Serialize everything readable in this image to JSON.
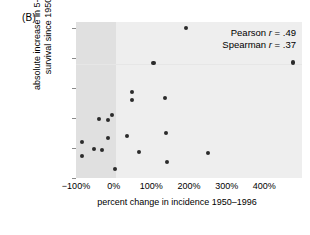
{
  "panel": {
    "label": "(B)"
  },
  "annotations": {
    "pearson_prefix": "Pearson ",
    "pearson_var": "r",
    "pearson_value": " = .49",
    "spearman_prefix": "Spearman ",
    "spearman_var": "r",
    "spearman_value": " = .37"
  },
  "axes": {
    "xlabel": "percent change in incidence 1950–1996",
    "ylabel_line1": "absolute increase in 5-year",
    "ylabel_line2": "survival since 1950",
    "xticks": [
      "−100%",
      "0%",
      "100%",
      "200%",
      "300%",
      "400%"
    ],
    "yticks": [
      "0%",
      "10%",
      "20%",
      "30%",
      "40%",
      "50%"
    ]
  },
  "chart_data": {
    "type": "scatter",
    "title": "(B)",
    "xlabel": "percent change in incidence 1950–1996",
    "ylabel": "absolute increase in 5-year survival since 1950",
    "xlim": [
      -100,
      500
    ],
    "ylim": [
      0,
      52
    ],
    "xticks": [
      -100,
      0,
      100,
      200,
      300,
      400
    ],
    "yticks": [
      0,
      10,
      20,
      30,
      40,
      50
    ],
    "xtick_labels": [
      "−100%",
      "0%",
      "100%",
      "200%",
      "300%",
      "400%"
    ],
    "ytick_labels": [
      "0%",
      "10%",
      "20%",
      "30%",
      "40%",
      "50%"
    ],
    "grid": false,
    "legend": "none",
    "plot_background": "#eeeeee",
    "shaded_region": {
      "x_from": -100,
      "x_to": 0,
      "color": "#e0e0e0",
      "note": "darker band left of 0% (decreasing incidence)"
    },
    "marker_color": "#2b2b2b",
    "statistics": {
      "pearson_r": 0.49,
      "spearman_r": 0.37
    },
    "points": [
      {
        "x": -83,
        "y": 12.0
      },
      {
        "x": -83,
        "y": 7.3
      },
      {
        "x": -52,
        "y": 9.8
      },
      {
        "x": -38,
        "y": 19.7
      },
      {
        "x": -30,
        "y": 9.3
      },
      {
        "x": -14,
        "y": 19.3
      },
      {
        "x": -14,
        "y": 13.3
      },
      {
        "x": -5,
        "y": 21.0
      },
      {
        "x": 3,
        "y": 2.9
      },
      {
        "x": 36,
        "y": 13.9
      },
      {
        "x": 49,
        "y": 28.7
      },
      {
        "x": 49,
        "y": 25.9
      },
      {
        "x": 68,
        "y": 8.6
      },
      {
        "x": 106,
        "y": 38.4
      },
      {
        "x": 136,
        "y": 26.7
      },
      {
        "x": 140,
        "y": 15.0
      },
      {
        "x": 141,
        "y": 5.2
      },
      {
        "x": 192,
        "y": 50.0
      },
      {
        "x": 250,
        "y": 8.2
      },
      {
        "x": 476,
        "y": 38.5
      }
    ]
  }
}
